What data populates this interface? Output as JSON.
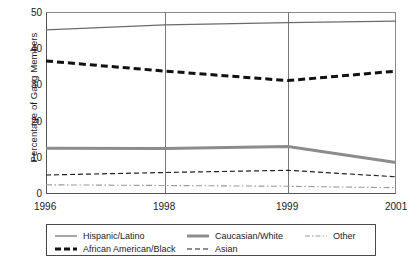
{
  "chart_data": {
    "type": "line",
    "title": "",
    "xlabel": "",
    "ylabel": "Percentage of Gang Members",
    "x": [
      "1996",
      "1998",
      "1999",
      "2001"
    ],
    "xtick_labels": [
      "1996",
      "1998",
      "1999",
      "2001"
    ],
    "ytick_labels": [
      "0",
      "10",
      "20",
      "30",
      "40",
      "50"
    ],
    "ylim": [
      0,
      50
    ],
    "grid": "vertical-only",
    "legend_position": "bottom",
    "series": [
      {
        "name": "Hispanic/Latino",
        "values": [
          45.2,
          46.6,
          47.2,
          47.6
        ],
        "style": "solid-thin",
        "color": "#6b6b6b"
      },
      {
        "name": "African American/Black",
        "values": [
          36.6,
          33.8,
          31.2,
          33.8
        ],
        "style": "dashed-thick",
        "color": "#111111"
      },
      {
        "name": "Caucasian/White",
        "values": [
          12.5,
          12.4,
          13.0,
          8.6
        ],
        "style": "solid-thick",
        "color": "#8c8c8c"
      },
      {
        "name": "Asian",
        "values": [
          5.1,
          5.8,
          6.4,
          4.6
        ],
        "style": "dashed-thin",
        "color": "#222222"
      },
      {
        "name": "Other",
        "values": [
          2.4,
          2.2,
          2.0,
          1.6
        ],
        "style": "dash-dot",
        "color": "#999999"
      }
    ]
  },
  "axis": {
    "y_title": "Percentage of Gang Members"
  },
  "legend": {
    "entries": [
      {
        "label": "Hispanic/Latino",
        "swatch": "line-solid-thin-gray"
      },
      {
        "label": "African American/Black",
        "swatch": "line-dashed-thick-black"
      },
      {
        "label": "Caucasian/White",
        "swatch": "line-solid-thick-gray"
      },
      {
        "label": "Asian",
        "swatch": "line-dashed-thin-black"
      },
      {
        "label": "Other",
        "swatch": "line-dash-dot-gray"
      }
    ]
  }
}
